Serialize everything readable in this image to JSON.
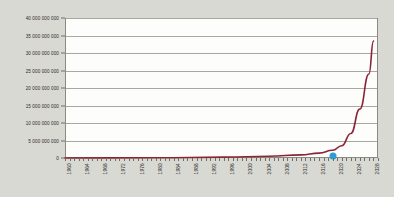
{
  "chart_data": {
    "type": "line",
    "title": "",
    "subtitle": "",
    "xlabel": "",
    "ylabel": "",
    "xlim": [
      1960,
      2029
    ],
    "ylim": [
      0,
      40000000000
    ],
    "grid": true,
    "legend": null,
    "legend_position": "none",
    "series_color": "#8b2435",
    "marker_color": "#2e9bd6",
    "plot_background": "#fdfdfb",
    "page_background": "#d9d9d4",
    "gridline_color": "#a8a89e",
    "axis_color": "#8a8a82",
    "y_ticks": [
      0,
      5000000000,
      10000000000,
      15000000000,
      20000000000,
      25000000000,
      30000000000,
      35000000000,
      40000000000
    ],
    "y_tick_labels": [
      "0",
      "5 000 000 000",
      "10 000 000 000",
      "15 000 000 000",
      "20 000 000 000",
      "25 000 000 000",
      "30 000 000 000",
      "35 000 000 000",
      "40 000 000 000"
    ],
    "x_tick_labels": [
      "1960",
      "1964",
      "1968",
      "1972",
      "1976",
      "1980",
      "1984",
      "1988",
      "1992",
      "1996",
      "2000",
      "2004",
      "2008",
      "2012",
      "2016",
      "2020",
      "2024",
      "2028"
    ],
    "x_minor_tick_interval": 1,
    "x_major_tick_interval": 4,
    "annotations": [
      {
        "name": "current-year-marker",
        "x": 2019,
        "y": 500000000,
        "label": ""
      }
    ],
    "x": [
      1960,
      1961,
      1962,
      1963,
      1964,
      1965,
      1966,
      1967,
      1968,
      1969,
      1970,
      1971,
      1972,
      1973,
      1974,
      1975,
      1976,
      1977,
      1978,
      1979,
      1980,
      1981,
      1982,
      1983,
      1984,
      1985,
      1986,
      1987,
      1988,
      1989,
      1990,
      1991,
      1992,
      1993,
      1994,
      1995,
      1996,
      1997,
      1998,
      1999,
      2000,
      2001,
      2002,
      2003,
      2004,
      2005,
      2006,
      2007,
      2008,
      2009,
      2010,
      2011,
      2012,
      2013,
      2014,
      2015,
      2016,
      2017,
      2018,
      2019,
      2020,
      2021,
      2022,
      2023,
      2024,
      2025,
      2026,
      2027,
      2028,
      2029
    ],
    "values": [
      3000000,
      3500000,
      4100000,
      4800000,
      5600000,
      6500000,
      7600000,
      8900000,
      10400000,
      12200000,
      14200000,
      16600000,
      19400000,
      22700000,
      26500000,
      31000000,
      36200000,
      42300000,
      49500000,
      57800000,
      67600000,
      79000000,
      92400000,
      108000000,
      126000000,
      148000000,
      173000000,
      202000000,
      236000000,
      276000000,
      322000000,
      377000000,
      440000000,
      515000000,
      602000000,
      703000000,
      822000000,
      961000000,
      1124000000,
      1314000000,
      1536000000,
      1795000000,
      2098000000,
      2452000000,
      2866000000,
      3350000000,
      3916000000,
      4577000000,
      5350000000,
      6253000000,
      7309000000,
      8543000000,
      9985000000,
      11671000000,
      13640000000,
      15943000000,
      18634000000,
      21780000000,
      25457000000,
      29755000000,
      260000000000,
      420000000000,
      700000000000,
      1200000000000,
      2100000000000,
      3600000000000,
      6300000000000,
      11000000000000,
      19000000000000,
      33400000000
    ],
    "curve_points": [
      {
        "year": 1960,
        "value": 0
      },
      {
        "year": 1980,
        "value": 60000000
      },
      {
        "year": 1995,
        "value": 250000000
      },
      {
        "year": 2005,
        "value": 500000000
      },
      {
        "year": 2012,
        "value": 900000000
      },
      {
        "year": 2016,
        "value": 1400000000
      },
      {
        "year": 2019,
        "value": 2200000000
      },
      {
        "year": 2021,
        "value": 3500000000
      },
      {
        "year": 2023,
        "value": 7000000000
      },
      {
        "year": 2025,
        "value": 14000000000
      },
      {
        "year": 2027,
        "value": 24000000000
      },
      {
        "year": 2028,
        "value": 33400000000
      }
    ]
  }
}
